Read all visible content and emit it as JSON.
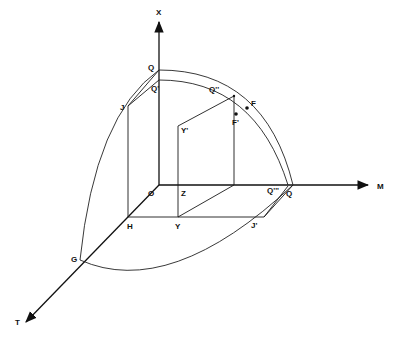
{
  "diagram": {
    "type": "3d-axes-geometric-construction",
    "axes": {
      "vertical": {
        "label": "X"
      },
      "horizontal": {
        "label": "M"
      },
      "depth": {
        "label": "T"
      }
    },
    "origin": {
      "label": "O"
    },
    "points": {
      "Q_top": {
        "label": "Q"
      },
      "Q_prime": {
        "label": "Q'"
      },
      "J": {
        "label": "J"
      },
      "H": {
        "label": "H"
      },
      "Q_double_prime": {
        "label": "Q''"
      },
      "F": {
        "label": "F"
      },
      "F_prime": {
        "label": "F'"
      },
      "Y_prime": {
        "label": "Y'"
      },
      "Y": {
        "label": "Y"
      },
      "Z": {
        "label": "Z"
      },
      "Q_right": {
        "label": "Q"
      },
      "Q_triple_prime": {
        "label": "Q'''"
      },
      "J_prime": {
        "label": "J'"
      },
      "G": {
        "label": "G"
      }
    },
    "colors": {
      "stroke": "#1a1a1a",
      "background": "#ffffff"
    }
  }
}
